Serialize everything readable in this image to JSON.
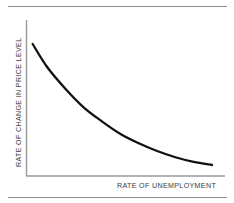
{
  "figure": {
    "name": "phillips-curve-figure",
    "background": "#ffffff",
    "rule_color": "#8c8c8c",
    "curve_color": "#111111",
    "axis_color": "#9a9a9a",
    "label_color": "#3b3b3b"
  },
  "chart_data": {
    "type": "line",
    "title": "",
    "xlabel": "RATE OF UNEMPLOYMENT",
    "ylabel": "RATE OF CHANGE IN PRICE LEVEL",
    "grid": false,
    "legend": null,
    "xlim": [
      0,
      100
    ],
    "ylim": [
      0,
      100
    ],
    "xticks": [],
    "yticks": [],
    "series": [
      {
        "name": "Phillips curve",
        "x": [
          2,
          10,
          20,
          30,
          40,
          50,
          60,
          70,
          80,
          90,
          100
        ],
        "y": [
          87,
          72,
          58,
          46,
          37,
          29,
          23,
          18,
          14,
          11,
          9
        ]
      }
    ],
    "annotations": []
  },
  "labels": {
    "x_axis": "RATE OF UNEMPLOYMENT",
    "y_axis": "RATE OF CHANGE IN PRICE LEVEL"
  }
}
